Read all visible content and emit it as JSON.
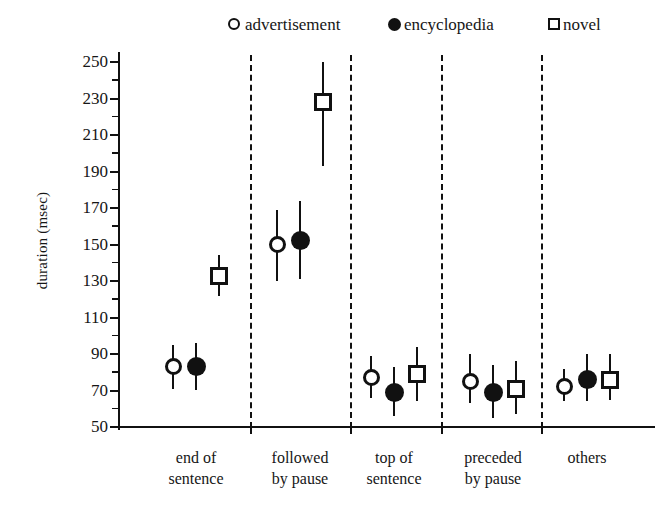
{
  "chart_data": {
    "type": "scatter",
    "title": "",
    "xlabel": "",
    "ylabel": "duration (msec)",
    "ylim": [
      50,
      250
    ],
    "ytick_step": 20,
    "yticks": [
      50,
      70,
      90,
      110,
      130,
      150,
      170,
      190,
      210,
      230,
      250
    ],
    "ytick_labels": [
      "50",
      "70",
      "90",
      "110",
      "130",
      "150",
      "170",
      "190",
      "210",
      "230",
      "250"
    ],
    "minor_tick_step": 10,
    "grid": false,
    "legend_position": "top-center",
    "error_bars": "yes",
    "group_separators": "dashed vertical lines between categories",
    "categories": [
      "end of sentence",
      "followed by pause",
      "top of sentence",
      "preceded by pause",
      "others"
    ],
    "category_lines": [
      [
        "end of",
        "sentence"
      ],
      [
        "followed",
        "by pause"
      ],
      [
        "top of",
        "sentence"
      ],
      [
        "preceded",
        "by pause"
      ],
      [
        "others",
        ""
      ]
    ],
    "series": [
      {
        "name": "advertisement",
        "marker": "open-circle",
        "values": [
          83,
          150,
          77,
          75,
          72
        ],
        "err_low": [
          71,
          130,
          66,
          63,
          64
        ],
        "err_high": [
          95,
          169,
          89,
          90,
          82
        ]
      },
      {
        "name": "encyclopedia",
        "marker": "filled-circle",
        "values": [
          83,
          152,
          69,
          69,
          76
        ],
        "err_low": [
          70,
          131,
          56,
          55,
          64
        ],
        "err_high": [
          96,
          174,
          83,
          84,
          90
        ]
      },
      {
        "name": "novel",
        "marker": "open-square",
        "values": [
          133,
          228,
          79,
          71,
          76
        ],
        "err_low": [
          122,
          193,
          64,
          57,
          65
        ],
        "err_high": [
          144,
          250,
          94,
          86,
          90
        ]
      }
    ]
  },
  "legend": {
    "items": [
      {
        "label": "advertisement",
        "marker": "open-circle"
      },
      {
        "label": "encyclopedia",
        "marker": "filled-circle"
      },
      {
        "label": "novel",
        "marker": "open-square"
      }
    ]
  },
  "axis": {
    "y_title": "duration (msec)"
  }
}
